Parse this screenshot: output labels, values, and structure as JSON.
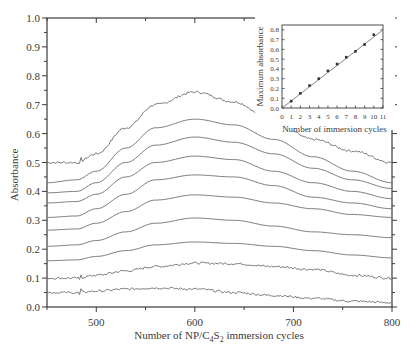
{
  "chart_data": [
    {
      "type": "line",
      "title": "",
      "xlabel": "Number of NP/C4S2 immersion cycles",
      "xlabel_parts": {
        "pre": "Number of NP/C",
        "sub1": "4",
        "mid": "S",
        "sub2": "2",
        "post": " immersion cycles"
      },
      "ylabel": "Absorbance",
      "xlim": [
        450,
        800
      ],
      "ylim": [
        0.0,
        1.0
      ],
      "xticks": [
        500,
        600,
        700,
        800
      ],
      "xtick_labels": [
        "500",
        "600",
        "700",
        "800"
      ],
      "yticks": [
        0.0,
        0.1,
        0.2,
        0.3,
        0.4,
        0.5,
        0.6,
        0.7,
        0.8,
        0.9,
        1.0
      ],
      "ytick_labels": [
        "0.0",
        "0.1",
        "0.2",
        "0.3",
        "0.4",
        "0.5",
        "0.6",
        "0.7",
        "0.8",
        "0.9",
        "1.0"
      ],
      "grid": false,
      "legend": "none",
      "line_color": "#7a7a7a",
      "x": [
        450,
        480,
        500,
        530,
        560,
        600,
        640,
        680,
        720,
        760,
        800
      ],
      "series": [
        {
          "name": "cycle 10",
          "noisy": true,
          "values": [
            0.5,
            0.5,
            0.53,
            0.62,
            0.7,
            0.744,
            0.71,
            0.64,
            0.58,
            0.54,
            0.5
          ]
        },
        {
          "name": "cycle 9",
          "noisy": false,
          "values": [
            0.43,
            0.44,
            0.47,
            0.55,
            0.62,
            0.65,
            0.63,
            0.58,
            0.52,
            0.47,
            0.43
          ]
        },
        {
          "name": "cycle 8",
          "noisy": false,
          "values": [
            0.395,
            0.4,
            0.43,
            0.5,
            0.56,
            0.588,
            0.57,
            0.53,
            0.48,
            0.44,
            0.41
          ]
        },
        {
          "name": "cycle 7",
          "noisy": false,
          "values": [
            0.36,
            0.365,
            0.39,
            0.45,
            0.5,
            0.522,
            0.51,
            0.47,
            0.43,
            0.4,
            0.375
          ]
        },
        {
          "name": "cycle 6",
          "noisy": false,
          "values": [
            0.31,
            0.315,
            0.34,
            0.39,
            0.44,
            0.457,
            0.45,
            0.42,
            0.38,
            0.36,
            0.34
          ]
        },
        {
          "name": "cycle 5",
          "noisy": false,
          "values": [
            0.266,
            0.27,
            0.29,
            0.33,
            0.37,
            0.388,
            0.38,
            0.36,
            0.34,
            0.32,
            0.31
          ]
        },
        {
          "name": "cycle 4",
          "noisy": false,
          "values": [
            0.21,
            0.215,
            0.23,
            0.26,
            0.29,
            0.308,
            0.3,
            0.28,
            0.26,
            0.25,
            0.24
          ]
        },
        {
          "name": "cycle 3",
          "noisy": false,
          "values": [
            0.16,
            0.163,
            0.175,
            0.195,
            0.215,
            0.225,
            0.22,
            0.21,
            0.195,
            0.18,
            0.17
          ]
        },
        {
          "name": "cycle 2",
          "noisy": true,
          "values": [
            0.1,
            0.1,
            0.11,
            0.125,
            0.14,
            0.152,
            0.15,
            0.14,
            0.13,
            0.11,
            0.1
          ]
        },
        {
          "name": "cycle 1",
          "noisy": true,
          "values": [
            0.05,
            0.05,
            0.055,
            0.062,
            0.066,
            0.062,
            0.05,
            0.04,
            0.03,
            0.02,
            0.015
          ]
        }
      ]
    },
    {
      "type": "scatter",
      "title": "",
      "inset": true,
      "xlabel": "Number of immersion cycles",
      "ylabel": "Maximum absorbance",
      "xlim": [
        0,
        11
      ],
      "ylim": [
        0.0,
        0.85
      ],
      "xticks": [
        0,
        1,
        2,
        3,
        4,
        5,
        6,
        7,
        8,
        9,
        10,
        11
      ],
      "xtick_labels": [
        "0",
        "1",
        "2",
        "3",
        "4",
        "5",
        "6",
        "7",
        "8",
        "9",
        "10",
        "11"
      ],
      "yticks": [
        0.0,
        0.1,
        0.2,
        0.3,
        0.4,
        0.5,
        0.6,
        0.7,
        0.8
      ],
      "ytick_labels": [
        "0.0",
        "0.1",
        "0.2",
        "0.3",
        "0.4",
        "0.5",
        "0.6",
        "0.7",
        "0.8"
      ],
      "x": [
        1,
        2,
        3,
        4,
        5,
        6,
        7,
        8,
        9,
        10
      ],
      "values": [
        0.07,
        0.15,
        0.23,
        0.3,
        0.38,
        0.45,
        0.52,
        0.58,
        0.65,
        0.75
      ],
      "fit_line": {
        "x": [
          0,
          11
        ],
        "y": [
          0.0,
          0.8
        ]
      },
      "grid": false
    }
  ]
}
